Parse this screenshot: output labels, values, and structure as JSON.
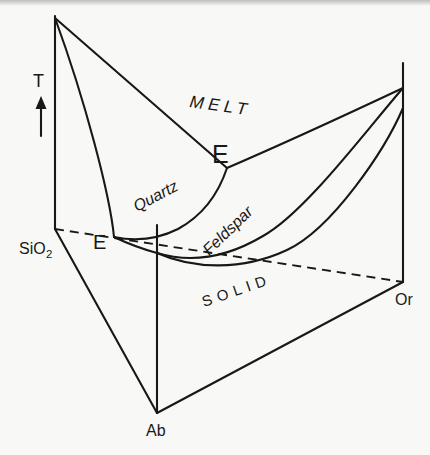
{
  "figure": {
    "background_color": "#f8f8f6",
    "ink_color": "#181816",
    "labels": {
      "temperature_axis": "T",
      "melt_region": "MELT",
      "quartz_field": "Quartz",
      "feldspar_field": "Feldspar",
      "solid_region": "SOLID",
      "eutectic_back": "E",
      "eutectic_front": "E",
      "silica_corner_main": "SiO",
      "silica_corner_subscript": "2",
      "albite_corner": "Ab",
      "orthoclase_corner": "Or"
    },
    "paths": {
      "sio2_edge": "M55,16 L55,229",
      "ab_edge": "M157,225 L157,413",
      "or_edge": "M403,63 L403,282",
      "base_edge_sio2_ab": "M55,229 L157,413",
      "base_edge_ab_or": "M157,413 L403,282",
      "hidden_base_edge_sio2_or": "M55,229 L403,282",
      "sio2_ab_liquidus": "M55,18 C85,100 110,195 114,237",
      "ab_liquidus_branch": "M114,237 Q135,247 157,253",
      "sio2_or_liquidus": "M55,18 L227,168",
      "or_liquidus_branch": "M227,168 C285,143 352,112 403,88",
      "cotectic_boundary": "M114,237 C138,242 160,238 178,229 C200,217 217,198 227,168",
      "alkali_feldspar_liquidus": "M157,253 C190,263 226,258 263,236 C305,213 368,128 403,88",
      "alkali_feldspar_solidus": "M157,253 C193,269 242,271 287,250 C332,229 385,150 403,108",
      "temperature_arrow_shaft": "M41,136 L41,103"
    },
    "arrowhead_points": "41,96 35.5,109 46.5,109"
  },
  "chart_data": {
    "type": "phase-diagram-3d-sketch",
    "system_corners": [
      "SiO2",
      "Ab",
      "Or"
    ],
    "vertical_axis": "T",
    "regions": [
      "MELT",
      "SOLID"
    ],
    "liquidus_fields": [
      "Quartz",
      "Feldspar"
    ],
    "marked_points": [
      "E",
      "E"
    ]
  }
}
